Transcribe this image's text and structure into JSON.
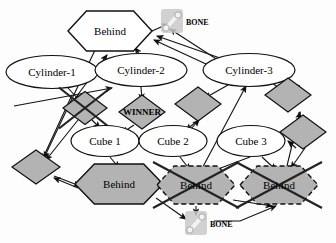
{
  "diagram": {
    "type": "node-link-graph",
    "colors": {
      "node_fill_white": "#ffffff",
      "node_fill_gray": "#b3b3b3",
      "stroke": "#111111",
      "text": "#000000",
      "bone_icon": "#9a9a9a"
    },
    "nodes": [
      {
        "id": "behind-top",
        "label": "Behind",
        "shape": "hexagon",
        "fill": "white",
        "border": "solid",
        "crossed": false,
        "x": 110,
        "y": 31,
        "w": 84,
        "h": 40
      },
      {
        "id": "bone-top",
        "label": "BONE",
        "shape": "icon",
        "fill": "gray",
        "border": "none",
        "crossed": false,
        "x": 172,
        "y": 21,
        "w": 22,
        "h": 24
      },
      {
        "id": "cylinder-1",
        "label": "Cylinder-1",
        "shape": "ellipse",
        "fill": "white",
        "border": "solid",
        "crossed": false,
        "x": 52,
        "y": 72,
        "w": 92,
        "h": 33
      },
      {
        "id": "cylinder-2",
        "label": "Cylinder-2",
        "shape": "ellipse",
        "fill": "white",
        "border": "solid",
        "crossed": false,
        "x": 141,
        "y": 70,
        "w": 92,
        "h": 33
      },
      {
        "id": "cylinder-3",
        "label": "Cylinder-3",
        "shape": "ellipse",
        "fill": "white",
        "border": "solid",
        "crossed": false,
        "x": 249,
        "y": 70,
        "w": 92,
        "h": 33
      },
      {
        "id": "diamond-crossed-left",
        "label": "",
        "shape": "diamond",
        "fill": "gray",
        "border": "solid",
        "crossed": true,
        "x": 85,
        "y": 108,
        "w": 44,
        "h": 33
      },
      {
        "id": "diamond-winner",
        "label": "WINNER",
        "shape": "diamond",
        "fill": "gray",
        "border": "solid",
        "crossed": false,
        "x": 142,
        "y": 112,
        "w": 46,
        "h": 34
      },
      {
        "id": "diamond-mid",
        "label": "",
        "shape": "diamond",
        "fill": "gray",
        "border": "solid",
        "crossed": false,
        "x": 198,
        "y": 104,
        "w": 46,
        "h": 34
      },
      {
        "id": "diamond-right-upper",
        "label": "",
        "shape": "diamond",
        "fill": "gray",
        "border": "solid",
        "crossed": false,
        "x": 288,
        "y": 95,
        "w": 46,
        "h": 34
      },
      {
        "id": "diamond-right-lower",
        "label": "",
        "shape": "diamond",
        "fill": "gray",
        "border": "solid",
        "crossed": false,
        "x": 303,
        "y": 132,
        "w": 46,
        "h": 34
      },
      {
        "id": "cube-1",
        "label": "Cube 1",
        "shape": "ellipse",
        "fill": "white",
        "border": "solid",
        "crossed": false,
        "x": 105,
        "y": 141,
        "w": 68,
        "h": 31
      },
      {
        "id": "cube-2",
        "label": "Cube 2",
        "shape": "ellipse",
        "fill": "white",
        "border": "solid",
        "crossed": false,
        "x": 173,
        "y": 141,
        "w": 68,
        "h": 31
      },
      {
        "id": "cube-3",
        "label": "Cube 3",
        "shape": "ellipse",
        "fill": "white",
        "border": "solid",
        "crossed": false,
        "x": 251,
        "y": 141,
        "w": 68,
        "h": 31
      },
      {
        "id": "diamond-bottom-left",
        "label": "",
        "shape": "diamond",
        "fill": "gray",
        "border": "solid",
        "crossed": false,
        "x": 36,
        "y": 167,
        "w": 48,
        "h": 34
      },
      {
        "id": "behind-bottom-left",
        "label": "Behind",
        "shape": "hexagon",
        "fill": "gray",
        "border": "solid",
        "crossed": false,
        "x": 119,
        "y": 184,
        "w": 88,
        "h": 40
      },
      {
        "id": "behind-bottom-mid",
        "label": "Behind",
        "shape": "hexagon",
        "fill": "gray",
        "border": "dashed",
        "crossed": true,
        "x": 196,
        "y": 185,
        "w": 78,
        "h": 38
      },
      {
        "id": "behind-bottom-right",
        "label": "Behind",
        "shape": "hexagon",
        "fill": "gray",
        "border": "dashed",
        "crossed": true,
        "x": 279,
        "y": 185,
        "w": 78,
        "h": 38
      },
      {
        "id": "bone-bottom",
        "label": "BONE",
        "shape": "icon",
        "fill": "gray",
        "border": "none",
        "crossed": false,
        "x": 196,
        "y": 223,
        "w": 22,
        "h": 24
      }
    ],
    "edges": [
      {
        "from": "cylinder-1",
        "to": "behind-top"
      },
      {
        "from": "cylinder-2",
        "to": "behind-top"
      },
      {
        "from": "behind-top",
        "to": "bone-top"
      },
      {
        "from": "cylinder-3",
        "to": "bone-top"
      },
      {
        "from": "cylinder-1",
        "to": "diamond-crossed-left"
      },
      {
        "from": "cylinder-2",
        "to": "diamond-winner"
      },
      {
        "from": "cylinder-3",
        "to": "diamond-mid"
      },
      {
        "from": "cylinder-3",
        "to": "diamond-right-upper"
      },
      {
        "from": "diamond-crossed-left",
        "to": "cube-1"
      },
      {
        "from": "diamond-winner",
        "to": "cube-1"
      },
      {
        "from": "diamond-mid",
        "to": "cube-2"
      },
      {
        "from": "diamond-right-lower",
        "to": "cube-3"
      },
      {
        "from": "cube-1",
        "to": "behind-bottom-left"
      },
      {
        "from": "cube-2",
        "to": "behind-bottom-mid"
      },
      {
        "from": "cube-3",
        "to": "behind-bottom-mid"
      },
      {
        "from": "cube-3",
        "to": "behind-bottom-right"
      },
      {
        "from": "diamond-bottom-left",
        "to": "behind-bottom-left"
      },
      {
        "from": "behind-top",
        "to": "diamond-bottom-left"
      },
      {
        "from": "behind-bottom-left",
        "to": "bone-bottom"
      },
      {
        "from": "behind-bottom-mid",
        "to": "bone-bottom"
      },
      {
        "from": "behind-bottom-mid",
        "to": "behind-bottom-right"
      },
      {
        "from": "diamond-right-upper",
        "to": "behind-bottom-right"
      }
    ]
  }
}
